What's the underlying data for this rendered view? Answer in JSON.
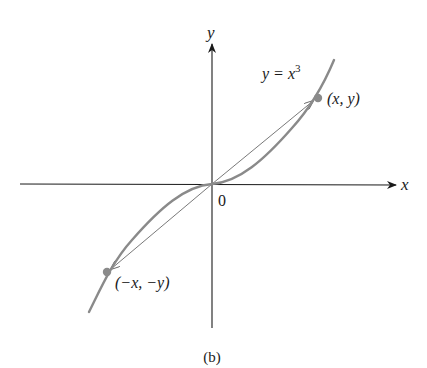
{
  "figure": {
    "caption": "(b)"
  },
  "axes": {
    "x_label": "x",
    "y_label": "y",
    "origin_label": "0"
  },
  "curve": {
    "equation_lhs": "y = x",
    "equation_exp": "3",
    "color": "#8a8a8a"
  },
  "points": [
    {
      "label": "(x, y)",
      "color": "#8a8a8a"
    },
    {
      "label": "(−x, −y)",
      "color": "#8a8a8a"
    }
  ],
  "colors": {
    "axis": "#1a1a1a",
    "vector": "#6a6a6a",
    "curve": "#8a8a8a"
  }
}
